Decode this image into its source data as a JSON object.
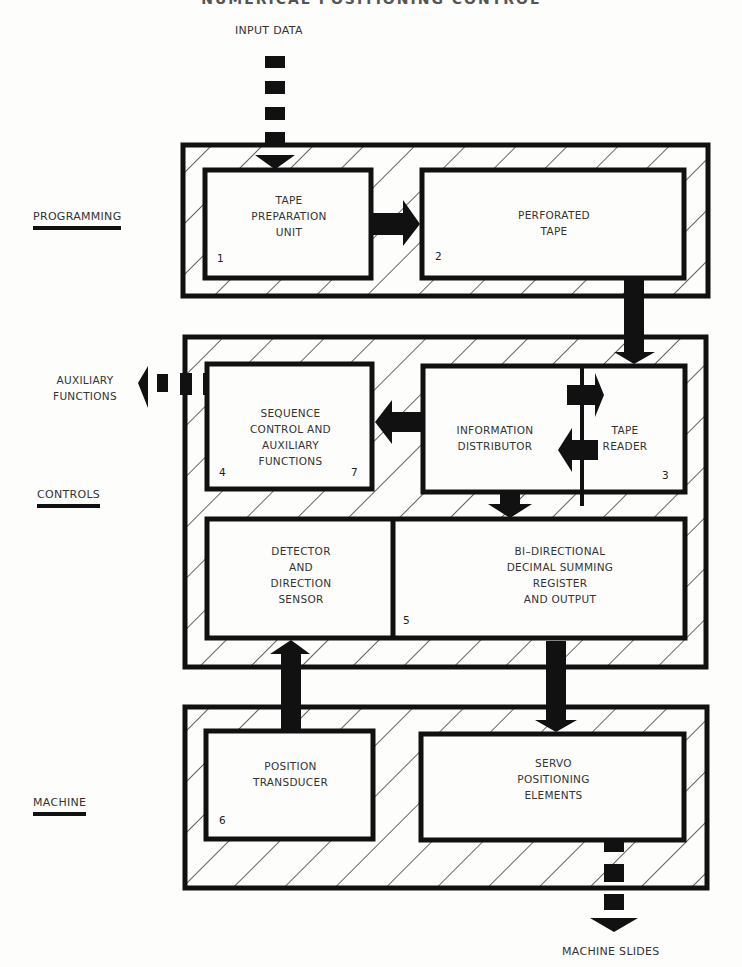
{
  "title": "NUMERICAL POSITIONING CONTROL",
  "input_label": "INPUT DATA",
  "output_label": "MACHINE SLIDES",
  "auxiliary_label": "AUXILIARY\nFUNCTIONS",
  "sections": {
    "programming": "PROGRAMMING",
    "controls": "CONTROLS",
    "machine": "MACHINE"
  },
  "blocks": {
    "tape_prep": {
      "label": "TAPE\nPREPARATION\nUNIT",
      "num": "1"
    },
    "perforated": {
      "label": "PERFORATED\nTAPE",
      "num": "2"
    },
    "info_dist": {
      "label": "INFORMATION\nDISTRIBUTOR"
    },
    "tape_reader": {
      "label": "TAPE\nREADER",
      "num": "3"
    },
    "sequence": {
      "label": "SEQUENCE\nCONTROL AND\nAUXILIARY\nFUNCTIONS",
      "num": "4",
      "num2": "7"
    },
    "detector": {
      "label": "DETECTOR\nAND\nDIRECTION\nSENSOR"
    },
    "summing": {
      "label": "BI–DIRECTIONAL\nDECIMAL SUMMING\nREGISTER\nAND OUTPUT",
      "num": "5"
    },
    "transducer": {
      "label": "POSITION\nTRANSDUCER",
      "num": "6"
    },
    "servo": {
      "label": "SERVO\nPOSITIONING\nELEMENTS"
    }
  }
}
